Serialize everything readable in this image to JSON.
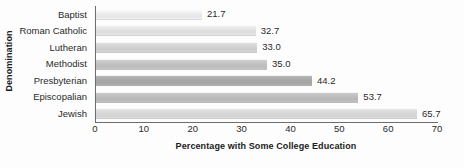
{
  "chart_data": {
    "type": "bar",
    "orientation": "horizontal",
    "title": "",
    "xlabel": "Percentage with Some College Education",
    "ylabel": "Denomination",
    "categories": [
      "Baptist",
      "Roman Catholic",
      "Lutheran",
      "Methodist",
      "Presbyterian",
      "Episcopalian",
      "Jewish"
    ],
    "values": [
      21.7,
      32.7,
      33.0,
      35.0,
      44.2,
      53.7,
      65.7
    ],
    "value_labels": [
      "21.7",
      "32.7",
      "33.0",
      "35.0",
      "44.2",
      "53.7",
      "65.7"
    ],
    "bar_colors": [
      "#ececec",
      "#e2e2e2",
      "#d2d2d2",
      "#c2c2c2",
      "#a9a9a9",
      "#bdbdbd",
      "#d8d8d8"
    ],
    "xlim": [
      0,
      70
    ],
    "xticks": [
      0,
      10,
      20,
      30,
      40,
      50,
      60,
      70
    ],
    "xtick_labels": [
      "0",
      "10",
      "20",
      "30",
      "40",
      "50",
      "60",
      "70"
    ],
    "grid": false,
    "legend": false,
    "axis_color": "#6d6d6d",
    "background": "#fdfdfd",
    "text_color": "#2a2a2a"
  }
}
